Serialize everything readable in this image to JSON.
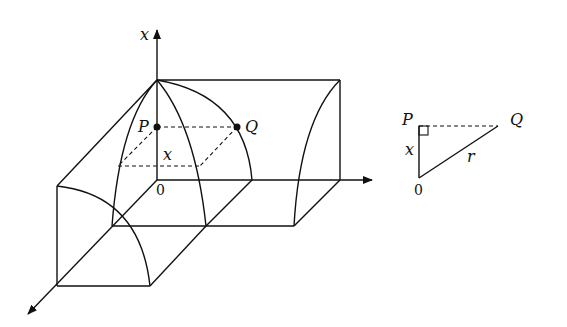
{
  "figure": {
    "main_solid": {
      "labels": {
        "axis_x": "x",
        "origin": "0",
        "point_p": "P",
        "point_q": "Q",
        "height_x": "x"
      }
    },
    "triangle": {
      "labels": {
        "point_p": "P",
        "point_q": "Q",
        "origin": "0",
        "side_x": "x",
        "hypotenuse_r": "r"
      }
    },
    "colors": {
      "stroke": "#111111",
      "background": "#ffffff"
    }
  }
}
